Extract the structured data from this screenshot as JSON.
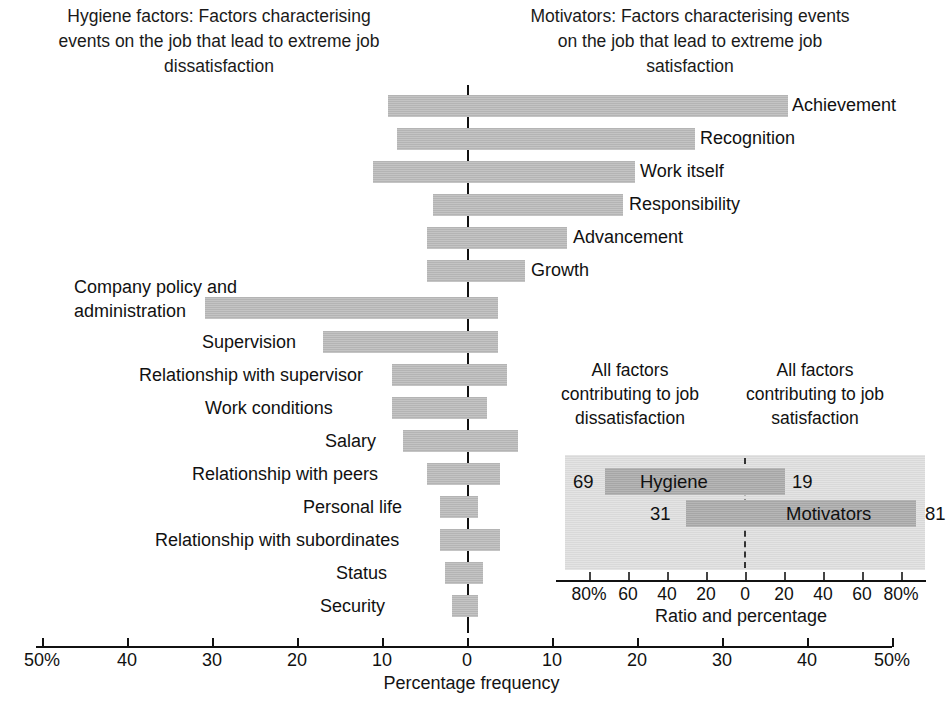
{
  "headers": {
    "left": "Hygiene factors: Factors characterising events on the job that lead to extreme job dissatisfaction",
    "right": "Motivators: Factors characterising events on the job that lead to extreme job satisfaction"
  },
  "axis": {
    "title": "Percentage frequency",
    "ticks": [
      "50%",
      "40",
      "30",
      "20",
      "10",
      "0",
      "10",
      "20",
      "30",
      "40",
      "50%"
    ]
  },
  "inset": {
    "header_left": "All factors contributing to job dissatisfaction",
    "header_right": "All factors contributing to job satisfaction",
    "axis_title": "Ratio and percentage",
    "ticks": [
      "80%",
      "60",
      "40",
      "20",
      "0",
      "20",
      "40",
      "60",
      "80%"
    ],
    "rows": [
      {
        "label": "Hygiene",
        "left_value": "69",
        "right_value": "19"
      },
      {
        "label": "Motivators",
        "left_value": "31",
        "right_value": "81"
      }
    ]
  },
  "chart_data": {
    "type": "bar",
    "xlabel": "Percentage frequency",
    "ylabel": "",
    "xlim": [
      -50,
      50
    ],
    "grid": false,
    "legend": "none",
    "orientation": "horizontal",
    "note": "Each bar spans from its dissatisfaction (negative) percentage to its satisfaction (positive) percentage.",
    "items": [
      {
        "label": "Achievement",
        "group": "Motivators",
        "low": -9.5,
        "high": 37.5
      },
      {
        "label": "Recognition",
        "group": "Motivators",
        "low": -8.5,
        "high": 26.5
      },
      {
        "label": "Work itself",
        "group": "Motivators",
        "low": -11.0,
        "high": 19.5
      },
      {
        "label": "Responsibility",
        "group": "Motivators",
        "low": -4.0,
        "high": 18.0
      },
      {
        "label": "Advancement",
        "group": "Motivators",
        "low": -5.0,
        "high": 11.5
      },
      {
        "label": "Growth",
        "group": "Motivators",
        "low": -5.0,
        "high": 6.5
      },
      {
        "label": "Company policy and administration",
        "group": "Hygiene factors",
        "low": -31.0,
        "high": 3.5
      },
      {
        "label": "Supervision",
        "group": "Hygiene factors",
        "low": -17.0,
        "high": 3.5
      },
      {
        "label": "Relationship with supervisor",
        "group": "Hygiene factors",
        "low": -9.0,
        "high": 4.5
      },
      {
        "label": "Work conditions",
        "group": "Hygiene factors",
        "low": -9.0,
        "high": 2.0
      },
      {
        "label": "Salary",
        "group": "Hygiene factors",
        "low": -7.5,
        "high": 6.0
      },
      {
        "label": "Relationship with peers",
        "group": "Hygiene factors",
        "low": -4.5,
        "high": 4.0
      },
      {
        "label": "Personal life",
        "group": "Hygiene factors",
        "low": -3.0,
        "high": 1.5
      },
      {
        "label": "Relationship with subordinates",
        "group": "Hygiene factors",
        "low": -3.0,
        "high": 4.0
      },
      {
        "label": "Status",
        "group": "Hygiene factors",
        "low": -2.5,
        "high": 2.0
      },
      {
        "label": "Security",
        "group": "Hygiene factors",
        "low": -1.5,
        "high": 1.5
      }
    ],
    "inset": {
      "type": "bar",
      "xlabel": "Ratio and percentage",
      "xlim": [
        -90,
        90
      ],
      "series": [
        {
          "name": "Hygiene",
          "dissatisfaction": 69,
          "satisfaction": 19
        },
        {
          "name": "Motivators",
          "dissatisfaction": 31,
          "satisfaction": 81
        }
      ]
    }
  },
  "bars": [
    {
      "label": "Achievement",
      "bar_left": 388,
      "bar_width": 400,
      "top": 95,
      "label_left": 792,
      "label_top": 95,
      "align": "right"
    },
    {
      "label": "Recognition",
      "bar_left": 397,
      "bar_width": 298,
      "top": 128,
      "label_left": 700,
      "label_top": 128,
      "align": "right"
    },
    {
      "label": "Work itself",
      "bar_left": 373,
      "bar_width": 262,
      "top": 161,
      "label_left": 640,
      "label_top": 161,
      "align": "right"
    },
    {
      "label": "Responsibility",
      "bar_left": 433,
      "bar_width": 190,
      "top": 194,
      "label_left": 629,
      "label_top": 194,
      "align": "right"
    },
    {
      "label": "Advancement",
      "bar_left": 427,
      "bar_width": 140,
      "top": 227,
      "label_left": 573,
      "label_top": 227,
      "align": "right"
    },
    {
      "label": "Growth",
      "bar_left": 427,
      "bar_width": 98,
      "top": 260,
      "label_left": 531,
      "label_top": 260,
      "align": "right"
    },
    {
      "label": "Company policy and administration",
      "bar_left": 205,
      "bar_width": 293,
      "top": 297,
      "label_left": 74,
      "label_top": 275,
      "align": "multiline"
    },
    {
      "label": "Supervision",
      "bar_left": 323,
      "bar_width": 175,
      "top": 331,
      "label_left": 202,
      "label_top": 332,
      "align": "left"
    },
    {
      "label": "Relationship with supervisor",
      "bar_left": 392,
      "bar_width": 115,
      "top": 364,
      "label_left": 139,
      "label_top": 365,
      "align": "left"
    },
    {
      "label": "Work conditions",
      "bar_left": 392,
      "bar_width": 95,
      "top": 397,
      "label_left": 205,
      "label_top": 398,
      "align": "left"
    },
    {
      "label": "Salary",
      "bar_left": 403,
      "bar_width": 115,
      "top": 430,
      "label_left": 325,
      "label_top": 431,
      "align": "left"
    },
    {
      "label": "Relationship with peers",
      "bar_left": 427,
      "bar_width": 73,
      "top": 463,
      "label_left": 192,
      "label_top": 464,
      "align": "left"
    },
    {
      "label": "Personal life",
      "bar_left": 440,
      "bar_width": 38,
      "top": 496,
      "label_left": 303,
      "label_top": 497,
      "align": "left"
    },
    {
      "label": "Relationship with subordinates",
      "bar_left": 440,
      "bar_width": 60,
      "top": 529,
      "label_left": 155,
      "label_top": 530,
      "align": "left"
    },
    {
      "label": "Status",
      "bar_left": 445,
      "bar_width": 38,
      "top": 562,
      "label_left": 336,
      "label_top": 563,
      "align": "left"
    },
    {
      "label": "Security",
      "bar_left": 452,
      "bar_width": 26,
      "top": 595,
      "label_left": 320,
      "label_top": 596,
      "align": "left"
    }
  ]
}
